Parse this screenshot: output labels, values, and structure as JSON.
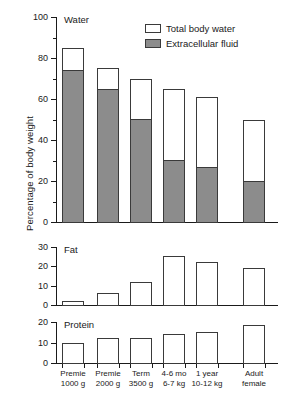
{
  "chart_data": {
    "type": "bar",
    "title": "",
    "ylabel": "Percentage of body weight",
    "xlabel": "",
    "categories": [
      "Premie\n1000 g",
      "Premie\n2000 g",
      "Term\n3500 g",
      "4-6 mo\n6-7 kg",
      "1 year\n10-12 kg",
      "Adult\nfemale"
    ],
    "category_lines": [
      [
        "Premie",
        "1000 g"
      ],
      [
        "Premie",
        "2000 g"
      ],
      [
        "Term",
        "3500 g"
      ],
      [
        "4-6 mo",
        "6-7 kg"
      ],
      [
        "1 year",
        "10-12 kg"
      ],
      [
        "Adult",
        "female"
      ]
    ],
    "legend": {
      "position": "top-right",
      "entries": [
        {
          "label": "Total body water",
          "swatch": "white",
          "color": "#ffffff"
        },
        {
          "label": "Extracellular fluid",
          "swatch": "gray",
          "color": "#8c8c8c"
        }
      ]
    },
    "panels": [
      {
        "name": "Water",
        "title": "Water",
        "ylim": [
          0,
          100
        ],
        "yticks": [
          0,
          20,
          40,
          60,
          80,
          100
        ],
        "ytick_labels": [
          "0",
          "20",
          "40",
          "60",
          "80",
          "100"
        ],
        "minor_tick_step": 10,
        "grid": false,
        "stacked": true,
        "series": [
          {
            "name": "Total body water",
            "values": [
              85,
              75,
              70,
              65,
              61,
              50
            ]
          },
          {
            "name": "Extracellular fluid",
            "values": [
              74,
              65,
              50,
              30,
              27,
              20
            ]
          }
        ]
      },
      {
        "name": "Fat",
        "title": "Fat",
        "ylim": [
          0,
          30
        ],
        "yticks": [
          0,
          10,
          20,
          30
        ],
        "ytick_labels": [
          "0",
          "10",
          "20",
          "30"
        ],
        "grid": false,
        "stacked": false,
        "series": [
          {
            "name": "Fat",
            "values": [
              2,
              6,
              12,
              25.5,
              22,
              19
            ]
          }
        ]
      },
      {
        "name": "Protein",
        "title": "Protein",
        "ylim": [
          0,
          20
        ],
        "yticks": [
          0,
          10,
          20
        ],
        "ytick_labels": [
          "0",
          "10",
          "20"
        ],
        "grid": false,
        "stacked": false,
        "series": [
          {
            "name": "Protein",
            "values": [
              10,
              12,
              12,
              14,
              15,
              18.5
            ]
          }
        ]
      }
    ]
  }
}
